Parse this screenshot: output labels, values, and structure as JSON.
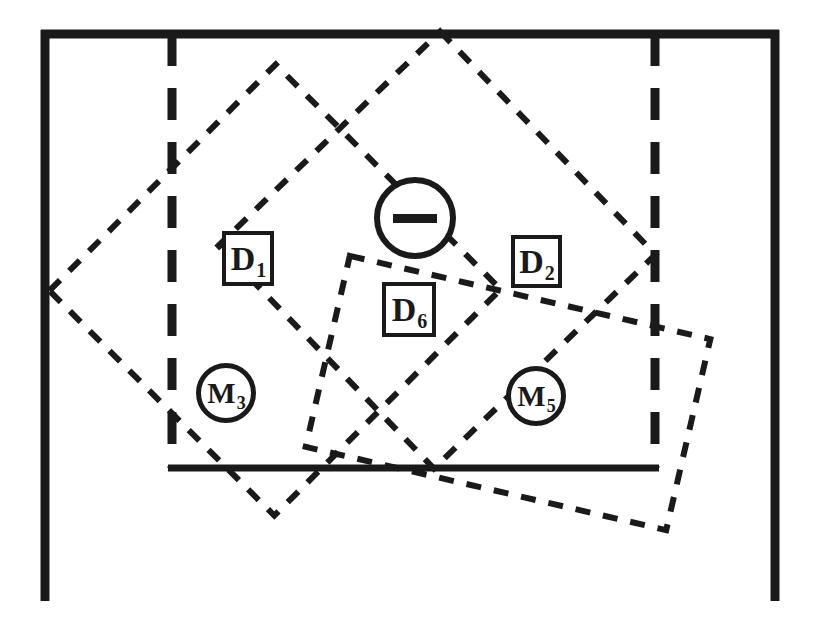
{
  "figure": {
    "background_color": "#ffffff",
    "ink_color": "#1a1a1a",
    "width": 813,
    "height": 635
  },
  "diagram": {
    "type": "schematic-overlay",
    "solid_frame": {
      "name": "outer-frame",
      "left": 45,
      "right": 775,
      "top": 30,
      "bottom_open_at": 600,
      "stroke_width": 9
    },
    "dashed_vertical_lines": [
      {
        "name": "left-dashed-divider",
        "x": 172,
        "y_start": 34,
        "y_end": 468
      },
      {
        "name": "right-dashed-divider",
        "x": 655,
        "y_start": 34,
        "y_end": 468
      }
    ],
    "inner_solid_line": {
      "name": "inner-horizontal-line",
      "y": 468,
      "x_start": 170,
      "x_end": 657,
      "stroke_width": 7
    },
    "dashed_rects": [
      {
        "name": "dashed-rect-left",
        "cx": 275,
        "cy": 290,
        "w": 320,
        "h": 318,
        "rotation_deg": -45
      },
      {
        "name": "dashed-rect-right",
        "cx": 437,
        "cy": 250,
        "w": 310,
        "h": 308,
        "rotation_deg": 46
      },
      {
        "name": "dashed-rect-lower",
        "cx": 508,
        "cy": 393,
        "w": 370,
        "h": 196,
        "rotation_deg": 13
      }
    ]
  },
  "labels": {
    "boxes": [
      {
        "name": "label-d1",
        "text": "D",
        "subscript": "1",
        "x": 222,
        "y": 231,
        "w": 52,
        "h": 55
      },
      {
        "name": "label-d2",
        "text": "D",
        "subscript": "2",
        "x": 511,
        "y": 235,
        "w": 51,
        "h": 53
      },
      {
        "name": "label-d6",
        "text": "D",
        "subscript": "6",
        "x": 382,
        "y": 282,
        "w": 54,
        "h": 55
      }
    ],
    "circles": [
      {
        "name": "label-m3",
        "text": "M",
        "subscript": "3",
        "cx": 226,
        "cy": 393,
        "r": 30
      },
      {
        "name": "label-m5",
        "text": "M",
        "subscript": "5",
        "cx": 536,
        "cy": 396,
        "r": 30
      }
    ],
    "minus_node": {
      "name": "minus-circle-node",
      "symbol": "minus",
      "cx": 415,
      "cy": 218,
      "r": 41
    }
  }
}
